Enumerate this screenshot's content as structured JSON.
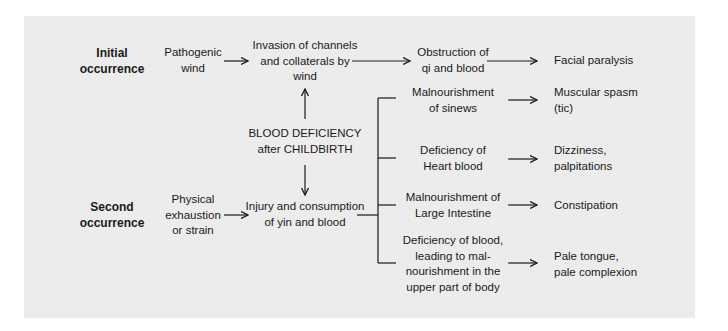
{
  "diagram": {
    "stages": {
      "initial": "Initial\noccurrence",
      "second": "Second\noccurrence"
    },
    "initial_row": {
      "cause": "Pathogenic\nwind",
      "step1": "Invasion of channels\nand collaterals by\nwind",
      "step2": "Obstruction of\nqi and blood",
      "outcome": "Facial paralysis"
    },
    "center": {
      "root": "BLOOD DEFICIENCY\nafter CHILDBIRTH"
    },
    "second_row": {
      "cause": "Physical\nexhaustion\nor strain",
      "step1": "Injury and consumption\nof yin and blood"
    },
    "branches": [
      {
        "mechanism": "Malnourishment\nof sinews",
        "outcome": "Muscular spasm\n(tic)"
      },
      {
        "mechanism": "Deficiency of\nHeart blood",
        "outcome": "Dizziness,\npalpitations"
      },
      {
        "mechanism": "Malnourishment of\nLarge Intestine",
        "outcome": "Constipation"
      },
      {
        "mechanism": "Deficiency of blood,\nleading to mal-\nnourishment in the\nupper part of body",
        "outcome": "Pale tongue,\npale complexion"
      }
    ],
    "colors": {
      "panel_bg": "#ececec",
      "line": "#1a1a1a"
    }
  }
}
